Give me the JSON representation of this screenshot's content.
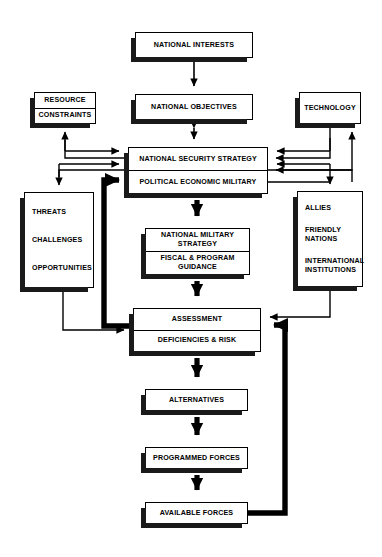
{
  "diagram": {
    "colors": {
      "line": "#000000",
      "fill": "#ffffff",
      "shadow": "#1a1a1a"
    },
    "nodes": [
      {
        "id": "national-interests",
        "name": "node-national-interests",
        "lines": [
          "NATIONAL INTERESTS"
        ],
        "x": 135,
        "y": 32,
        "w": 118,
        "h": 26,
        "style": "single",
        "shadow": "left"
      },
      {
        "id": "national-objectives",
        "name": "node-national-objectives",
        "lines": [
          "NATIONAL OBJECTIVES"
        ],
        "x": 135,
        "y": 94,
        "w": 118,
        "h": 26,
        "style": "single",
        "shadow": "left"
      },
      {
        "id": "resource-constraints",
        "name": "node-resource-constraints",
        "lines": [
          "RESOURCE",
          "CONSTRAINTS"
        ],
        "x": 34,
        "y": 92,
        "w": 62,
        "h": 32,
        "style": "single",
        "shadow": "left"
      },
      {
        "id": "technology",
        "name": "node-technology",
        "lines": [
          "TECHNOLOGY"
        ],
        "x": 299,
        "y": 92,
        "w": 62,
        "h": 32,
        "style": "single",
        "shadow": "left"
      },
      {
        "id": "national-security-strategy",
        "name": "node-national-security-strategy",
        "lines": [
          "NATIONAL SECURITY STRATEGY",
          "POLITICAL ECONOMIC MILITARY"
        ],
        "x": 128,
        "y": 147,
        "w": 140,
        "h": 47,
        "style": "double",
        "shadow": "left"
      },
      {
        "id": "threats-challenges-opportunities",
        "name": "node-threats-challenges-opportunities",
        "lines": [
          "THREATS",
          "CHALLENGES",
          "OPPORTUNITIES"
        ],
        "x": 24,
        "y": 192,
        "w": 70,
        "h": 96,
        "style": "list",
        "shadow": "left"
      },
      {
        "id": "allies-friendly-international",
        "name": "node-allies-friendly-nations-international-institutions",
        "lines": [
          "ALLIES",
          "FRIENDLY NATIONS",
          "INTERNATIONAL INSTITUTIONS"
        ],
        "x": 297,
        "y": 191,
        "w": 66,
        "h": 96,
        "style": "list",
        "shadow": "left"
      },
      {
        "id": "national-military-strategy",
        "name": "node-national-military-strategy",
        "lines": [
          "NATIONAL MILITARY STRATEGY",
          "FISCAL & PROGRAM GUIDANCE"
        ],
        "x": 145,
        "y": 228,
        "w": 105,
        "h": 47,
        "style": "double",
        "shadow": "left"
      },
      {
        "id": "assessment",
        "name": "node-assessment",
        "lines": [
          "ASSESSMENT",
          "DEFICIENCIES & RISK"
        ],
        "x": 133,
        "y": 308,
        "w": 128,
        "h": 44,
        "style": "double",
        "shadow": "left"
      },
      {
        "id": "alternatives",
        "name": "node-alternatives",
        "lines": [
          "ALTERNATIVES"
        ],
        "x": 145,
        "y": 389,
        "w": 103,
        "h": 22,
        "style": "single",
        "shadow": "left"
      },
      {
        "id": "programmed-forces",
        "name": "node-programmed-forces",
        "lines": [
          "PROGRAMMED FORCES"
        ],
        "x": 145,
        "y": 447,
        "w": 103,
        "h": 22,
        "style": "single",
        "shadow": "left"
      },
      {
        "id": "available-forces",
        "name": "node-available-forces",
        "lines": [
          "AVAILABLE FORCES"
        ],
        "x": 145,
        "y": 502,
        "w": 103,
        "h": 22,
        "style": "single",
        "shadow": "left"
      }
    ],
    "edges": [
      {
        "id": "e1",
        "name": "edge-national-interests-to-objectives",
        "from": "national-interests",
        "to": "national-objectives",
        "weight": "thin"
      },
      {
        "id": "e2",
        "name": "edge-national-objectives-to-nss",
        "from": "national-objectives",
        "to": "national-security-strategy",
        "weight": "thin",
        "bidirectional": true
      },
      {
        "id": "e3",
        "name": "edge-nss-to-resource-constraints",
        "from": "national-security-strategy",
        "to": "resource-constraints",
        "weight": "thin"
      },
      {
        "id": "e4",
        "name": "edge-resource-constraints-to-nss",
        "from": "resource-constraints",
        "to": "national-security-strategy",
        "weight": "thin"
      },
      {
        "id": "e5",
        "name": "edge-nss-to-threats",
        "from": "national-security-strategy",
        "to": "threats-challenges-opportunities",
        "weight": "thin"
      },
      {
        "id": "e6",
        "name": "edge-threats-to-nss",
        "from": "threats-challenges-opportunities",
        "to": "national-security-strategy",
        "weight": "thin"
      },
      {
        "id": "e7",
        "name": "edge-technology-to-nss",
        "from": "technology",
        "to": "national-security-strategy",
        "weight": "thin"
      },
      {
        "id": "e8",
        "name": "edge-nss-to-technology",
        "from": "national-security-strategy",
        "to": "technology",
        "weight": "thin"
      },
      {
        "id": "e9",
        "name": "edge-nss-to-allies",
        "from": "national-security-strategy",
        "to": "allies-friendly-international",
        "weight": "thin"
      },
      {
        "id": "e10",
        "name": "edge-allies-to-nss",
        "from": "allies-friendly-international",
        "to": "national-security-strategy",
        "weight": "thin"
      },
      {
        "id": "e11",
        "name": "edge-nss-to-national-military-strategy",
        "from": "national-security-strategy",
        "to": "national-military-strategy",
        "weight": "thick"
      },
      {
        "id": "e12",
        "name": "edge-national-military-strategy-to-assessment",
        "from": "national-military-strategy",
        "to": "assessment",
        "weight": "thick"
      },
      {
        "id": "e13",
        "name": "edge-threats-to-assessment",
        "from": "threats-challenges-opportunities",
        "to": "assessment",
        "weight": "thin"
      },
      {
        "id": "e14",
        "name": "edge-allies-to-assessment",
        "from": "allies-friendly-international",
        "to": "assessment",
        "weight": "thin"
      },
      {
        "id": "e15",
        "name": "edge-assessment-to-nss-feedback",
        "from": "assessment",
        "to": "national-security-strategy",
        "weight": "heavy"
      },
      {
        "id": "e16",
        "name": "edge-assessment-to-alternatives",
        "from": "assessment",
        "to": "alternatives",
        "weight": "thick"
      },
      {
        "id": "e17",
        "name": "edge-alternatives-to-programmed-forces",
        "from": "alternatives",
        "to": "programmed-forces",
        "weight": "thick"
      },
      {
        "id": "e18",
        "name": "edge-programmed-forces-to-available-forces",
        "from": "programmed-forces",
        "to": "available-forces",
        "weight": "thick"
      },
      {
        "id": "e19",
        "name": "edge-available-forces-to-assessment-feedback",
        "from": "available-forces",
        "to": "assessment",
        "weight": "heavy"
      }
    ]
  }
}
